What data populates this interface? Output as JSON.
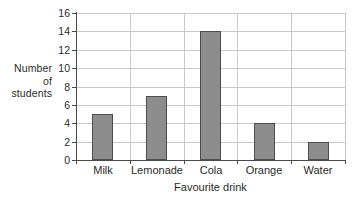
{
  "chart_data": {
    "type": "bar",
    "title": "",
    "categories": [
      "Milk",
      "Lemonade",
      "Cola",
      "Orange",
      "Water"
    ],
    "values": [
      5,
      7,
      14,
      4,
      2
    ],
    "xlabel": "Favourite drink",
    "ylabel": "Number of students",
    "ylabel_lines": [
      "Number",
      "of",
      "students"
    ],
    "ylim": [
      0,
      16
    ],
    "ytick_step": 2,
    "yticks": [
      0,
      2,
      4,
      6,
      8,
      10,
      12,
      14,
      16
    ],
    "ytick_labels": [
      "0",
      "2",
      "4",
      "6",
      "8",
      "10",
      "12",
      "14",
      "16"
    ],
    "grid": true,
    "legend": null,
    "colors": {
      "bar_fill": "#8d8d8d",
      "bar_border": "#4d4d4d",
      "grid": "#c9c9c9",
      "axis": "#4a4a4a",
      "background": "#ffffff",
      "text": "#2b2b2b"
    }
  }
}
